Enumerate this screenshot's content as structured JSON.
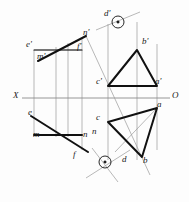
{
  "drawing": {
    "title": "Descriptive geometry two-plane projection drawing",
    "background_color": "#fdfdfd",
    "ink_color": "#1a1a1a",
    "thin_line_color": "#8a8a8a",
    "axis": {
      "left_label": "X",
      "right_label": "O",
      "y": 98
    },
    "labels": {
      "e_prime": "e'",
      "m_prime": "m'",
      "n_prime": "n'",
      "f_prime": "f'",
      "d_prime": "d'",
      "b_prime": "b'",
      "c_prime": "c'",
      "a_prime": "a'",
      "e": "e",
      "m": "m",
      "n": "n",
      "f": "f",
      "c": "c",
      "a": "a",
      "d": "d",
      "b": "b"
    },
    "points": {
      "e_prime": [
        34,
        50
      ],
      "m_prime": [
        38,
        61
      ],
      "n_prime": [
        82,
        38
      ],
      "f_prime": [
        82,
        50
      ],
      "d_prime": [
        112,
        22
      ],
      "b_prime": [
        137,
        50
      ],
      "c_prime": [
        108,
        86
      ],
      "a_prime": [
        157,
        86
      ],
      "e": [
        34,
        117
      ],
      "m": [
        34,
        135
      ],
      "n": [
        82,
        135
      ],
      "f": [
        82,
        148
      ],
      "c": [
        108,
        122
      ],
      "a": [
        157,
        108
      ],
      "d": [
        131,
        152
      ],
      "b": [
        142,
        157
      ]
    },
    "angle_markers": [
      {
        "cx": 118,
        "cy": 22,
        "note": "right-angle marker upper"
      },
      {
        "cx": 105,
        "cy": 162,
        "note": "right-angle marker lower"
      }
    ]
  }
}
